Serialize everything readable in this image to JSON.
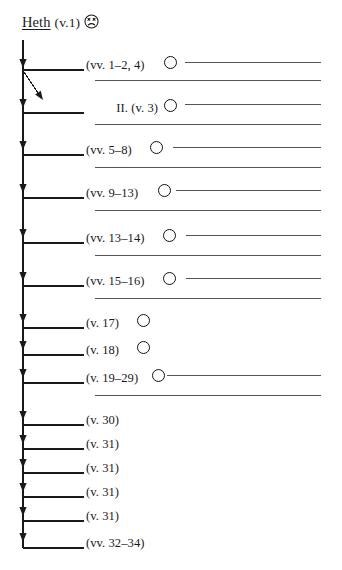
{
  "header": {
    "keyword": "Heth",
    "verse": "(v.1)",
    "face_icon": "frowning-face-icon"
  },
  "geometry": {
    "trunk_x": 23,
    "trunk_top": 40,
    "trunk_bottom": 548,
    "branch_start_x": 23,
    "branch_end_x": 84,
    "rule_start_x": 95,
    "rule_end_x": 321,
    "label_x": 86
  },
  "rows": [
    {
      "id": "row-1",
      "label": "(vv. 1–2, 4)",
      "label_align": "left",
      "label_x": 86,
      "branch_y": 70,
      "arrow_y": 68,
      "has_circle": true,
      "circle_x": 164,
      "circle_y": 56,
      "rule_y": 62,
      "rule_x1": 185,
      "rule_x2": 321,
      "extra_rule_y": 80,
      "extra_rule_x1": 95,
      "extra_rule_x2": 321,
      "diagonal": true
    },
    {
      "id": "row-2",
      "label": "II. (v. 3)",
      "label_align": "right",
      "label_x": 110,
      "branch_y": 113,
      "arrow_y": 108,
      "has_circle": true,
      "circle_x": 164,
      "circle_y": 98,
      "rule_y": 104,
      "rule_x1": 185,
      "rule_x2": 321,
      "extra_rule_y": 124,
      "extra_rule_x1": 95,
      "extra_rule_x2": 321,
      "diagonal": false
    },
    {
      "id": "row-3",
      "label": "(vv. 5–8)",
      "label_align": "left",
      "label_x": 86,
      "branch_y": 155,
      "arrow_y": 150,
      "has_circle": true,
      "circle_x": 150,
      "circle_y": 141,
      "rule_y": 147,
      "rule_x1": 173,
      "rule_x2": 321,
      "extra_rule_y": 167,
      "extra_rule_x1": 95,
      "extra_rule_x2": 321,
      "diagonal": false
    },
    {
      "id": "row-4",
      "label": "(vv. 9–13)",
      "label_align": "left",
      "label_x": 86,
      "branch_y": 198,
      "arrow_y": 193,
      "has_circle": true,
      "circle_x": 158,
      "circle_y": 184,
      "rule_y": 190,
      "rule_x1": 176,
      "rule_x2": 321,
      "extra_rule_y": 210,
      "extra_rule_x1": 95,
      "extra_rule_x2": 321,
      "diagonal": false
    },
    {
      "id": "row-5",
      "label": "(vv. 13–14)",
      "label_align": "left",
      "label_x": 86,
      "branch_y": 243,
      "arrow_y": 238,
      "has_circle": true,
      "circle_x": 163,
      "circle_y": 229,
      "rule_y": 235,
      "rule_x1": 186,
      "rule_x2": 321,
      "extra_rule_y": 255,
      "extra_rule_x1": 95,
      "extra_rule_x2": 321,
      "diagonal": false
    },
    {
      "id": "row-6",
      "label": "(vv. 15–16)",
      "label_align": "left",
      "label_x": 86,
      "branch_y": 286,
      "arrow_y": 281,
      "has_circle": true,
      "circle_x": 163,
      "circle_y": 272,
      "rule_y": 278,
      "rule_x1": 186,
      "rule_x2": 321,
      "extra_rule_y": 298,
      "extra_rule_x1": 95,
      "extra_rule_x2": 321,
      "diagonal": false
    },
    {
      "id": "row-7",
      "label": "(v. 17)",
      "label_align": "left",
      "label_x": 86,
      "branch_y": 328,
      "arrow_y": 323,
      "has_circle": true,
      "circle_x": 137,
      "circle_y": 314,
      "rule_y": null,
      "rule_x1": null,
      "rule_x2": null,
      "extra_rule_y": null,
      "extra_rule_x1": null,
      "extra_rule_x2": null,
      "diagonal": false
    },
    {
      "id": "row-8",
      "label": "(v. 18)",
      "label_align": "left",
      "label_x": 86,
      "branch_y": 355,
      "arrow_y": 350,
      "has_circle": true,
      "circle_x": 137,
      "circle_y": 341,
      "rule_y": null,
      "rule_x1": null,
      "rule_x2": null,
      "extra_rule_y": null,
      "extra_rule_x1": null,
      "extra_rule_x2": null,
      "diagonal": false
    },
    {
      "id": "row-9",
      "label": "(v. 19–29)",
      "label_align": "left",
      "label_x": 86,
      "branch_y": 383,
      "arrow_y": 378,
      "has_circle": true,
      "circle_x": 152,
      "circle_y": 369,
      "rule_y": 375,
      "rule_x1": 167,
      "rule_x2": 321,
      "extra_rule_y": 395,
      "extra_rule_x1": 95,
      "extra_rule_x2": 321,
      "diagonal": false
    },
    {
      "id": "row-10",
      "label": "(v. 30)",
      "label_align": "left",
      "label_x": 86,
      "branch_y": 425,
      "arrow_y": 420,
      "has_circle": false,
      "circle_x": null,
      "circle_y": null,
      "rule_y": null,
      "rule_x1": null,
      "rule_x2": null,
      "extra_rule_y": null,
      "extra_rule_x1": null,
      "extra_rule_x2": null,
      "diagonal": false
    },
    {
      "id": "row-11",
      "label": "(v. 31)",
      "label_align": "left",
      "label_x": 86,
      "branch_y": 449,
      "arrow_y": 444,
      "has_circle": false,
      "circle_x": null,
      "circle_y": null,
      "rule_y": null,
      "rule_x1": null,
      "rule_x2": null,
      "extra_rule_y": null,
      "extra_rule_x1": null,
      "extra_rule_x2": null,
      "diagonal": false
    },
    {
      "id": "row-12",
      "label": "(v. 31)",
      "label_align": "left",
      "label_x": 86,
      "branch_y": 473,
      "arrow_y": 468,
      "has_circle": false,
      "circle_x": null,
      "circle_y": null,
      "rule_y": null,
      "rule_x1": null,
      "rule_x2": null,
      "extra_rule_y": null,
      "extra_rule_x1": null,
      "extra_rule_x2": null,
      "diagonal": false
    },
    {
      "id": "row-13",
      "label": "(v. 31)",
      "label_align": "left",
      "label_x": 86,
      "branch_y": 497,
      "arrow_y": 492,
      "has_circle": false,
      "circle_x": null,
      "circle_y": null,
      "rule_y": null,
      "rule_x1": null,
      "rule_x2": null,
      "extra_rule_y": null,
      "extra_rule_x1": null,
      "extra_rule_x2": null,
      "diagonal": false
    },
    {
      "id": "row-14",
      "label": "(v. 31)",
      "label_align": "left",
      "label_x": 86,
      "branch_y": 521,
      "arrow_y": 516,
      "has_circle": false,
      "circle_x": null,
      "circle_y": null,
      "rule_y": null,
      "rule_x1": null,
      "rule_x2": null,
      "extra_rule_y": null,
      "extra_rule_x1": null,
      "extra_rule_x2": null,
      "diagonal": false
    },
    {
      "id": "row-15",
      "label": "(vv. 32–34)",
      "label_align": "left",
      "label_x": 86,
      "branch_y": 548,
      "arrow_y": 542,
      "has_circle": false,
      "circle_x": null,
      "circle_y": null,
      "rule_y": null,
      "rule_x1": null,
      "rule_x2": null,
      "extra_rule_y": null,
      "extra_rule_x1": null,
      "extra_rule_x2": null,
      "diagonal": false
    }
  ],
  "colors": {
    "ink": "#1a1a1a",
    "rule": "#555555",
    "paper": "#ffffff"
  }
}
